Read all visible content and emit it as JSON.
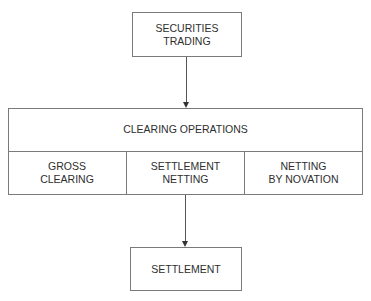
{
  "diagram": {
    "top_node": {
      "label": "SECURITIES\nTRADING"
    },
    "middle_node": {
      "title": "CLEARING OPERATIONS",
      "sub_nodes": [
        {
          "label": "GROSS\nCLEARING"
        },
        {
          "label": "SETTLEMENT\nNETTING"
        },
        {
          "label": "NETTING\nBY NOVATION"
        }
      ]
    },
    "bottom_node": {
      "label": "SETTLEMENT"
    },
    "edges": [
      {
        "from": "SECURITIES TRADING",
        "to": "CLEARING OPERATIONS"
      },
      {
        "from": "SETTLEMENT NETTING",
        "to": "SETTLEMENT"
      }
    ]
  }
}
